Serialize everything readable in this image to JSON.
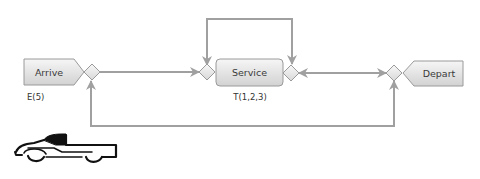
{
  "diagram": {
    "nodes": {
      "arrive": {
        "label": "Arrive",
        "param": "E(5)"
      },
      "service": {
        "label": "Service",
        "param": "T(1,2,3)"
      },
      "depart": {
        "label": "Depart"
      }
    },
    "icons": {
      "truck": "pickup-truck-icon"
    },
    "colors": {
      "connector": "#a0a0a0",
      "node_fill_top": "#f4f4f4",
      "node_fill_bottom": "#d4d4d4",
      "node_stroke": "#9a9a9a",
      "text": "#3a3a3a"
    }
  }
}
